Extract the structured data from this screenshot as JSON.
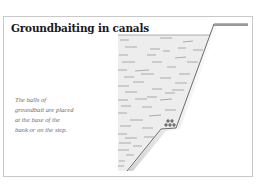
{
  "title": "Groundbaiting in canals",
  "caption": "The balls of groundbait are placed at the base of the bank or on the step.",
  "caption_lines": [
    "The balls of",
    "groundbait are placed",
    "at the base of the",
    "bank or on the step."
  ],
  "diagram": {
    "elements": [
      "water-body",
      "bank-slope",
      "step",
      "bank-top",
      "groundbait-balls"
    ],
    "colors": {
      "water_fill": "#ececec",
      "bank_shadow": "#bdbdbd",
      "bank_line": "#6e6e6e",
      "water_dash": "#8a8a8a",
      "border": "#c9c9c9"
    }
  }
}
